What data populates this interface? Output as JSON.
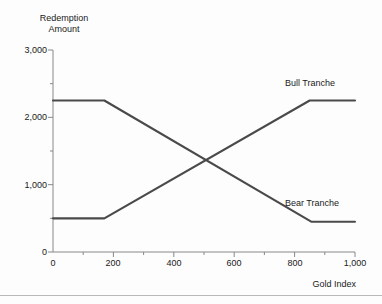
{
  "chart_data": {
    "type": "line",
    "title": "",
    "xlabel": "Gold Index",
    "ylabel": "Redemption\nAmount",
    "ylabel_line1": "Redemption",
    "ylabel_line2": "Amount",
    "xlim": [
      0,
      1000
    ],
    "ylim": [
      0,
      3000
    ],
    "grid": false,
    "legend_position": "inline-right",
    "x_ticks": [
      0,
      200,
      400,
      600,
      800,
      1000
    ],
    "x_tick_labels": [
      "0",
      "200",
      "400",
      "600",
      "800",
      "1,000"
    ],
    "x_minor_ticks": [
      100,
      300,
      500,
      700,
      900
    ],
    "y_ticks": [
      0,
      1000,
      2000,
      3000
    ],
    "y_tick_labels": [
      "0",
      "1,000",
      "2,000",
      "3,000"
    ],
    "y_minor_ticks": [
      500,
      1500,
      2500
    ],
    "line_color": "#4a4a4a",
    "axis_color": "#888888",
    "series": [
      {
        "name": "Bull Tranche",
        "label": "Bull Tranche",
        "x": [
          0,
          170,
          850,
          1000
        ],
        "values": [
          500,
          500,
          2250,
          2250
        ]
      },
      {
        "name": "Bear Tranche",
        "label": "Bear Tranche",
        "x": [
          0,
          170,
          855,
          1000
        ],
        "values": [
          2250,
          2250,
          450,
          450
        ]
      }
    ],
    "annotations": [
      {
        "text": "Bull Tranche",
        "x": 820,
        "y": 2520
      },
      {
        "text": "Bear Tranche",
        "x": 820,
        "y": 700
      }
    ]
  }
}
